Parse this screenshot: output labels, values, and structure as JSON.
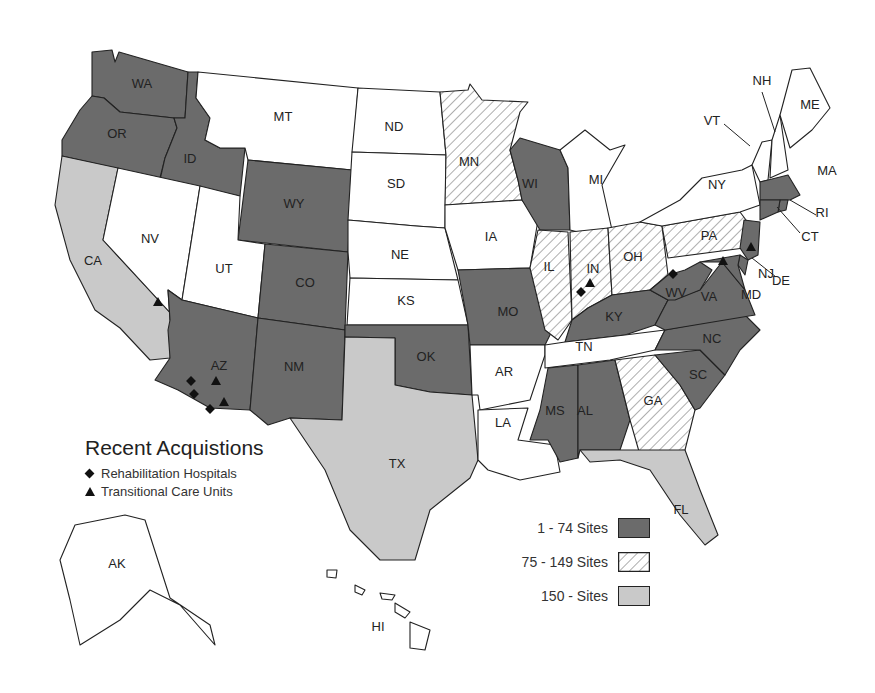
{
  "legend": {
    "title": "Recent Acquistions",
    "symbols": [
      {
        "icon": "diamond-icon",
        "label": "Rehabilitation Hospitals"
      },
      {
        "icon": "triangle-icon",
        "label": "Transitional Care Units"
      }
    ]
  },
  "key": [
    {
      "label": "1 - 74 Sites",
      "category": "low",
      "fill": "#6b6b6b"
    },
    {
      "label": "75 - 149 Sites",
      "category": "mid",
      "fill": "hatch"
    },
    {
      "label": "150 - Sites",
      "category": "high",
      "fill": "#c9c9c9"
    }
  ],
  "colors": {
    "low": "#6b6b6b",
    "high": "#c9c9c9",
    "none": "#ffffff",
    "hatch_line": "#777777"
  },
  "states": [
    {
      "code": "WA",
      "category": "low"
    },
    {
      "code": "OR",
      "category": "low"
    },
    {
      "code": "ID",
      "category": "low"
    },
    {
      "code": "MT",
      "category": "none"
    },
    {
      "code": "WY",
      "category": "low"
    },
    {
      "code": "CA",
      "category": "high"
    },
    {
      "code": "NV",
      "category": "none"
    },
    {
      "code": "UT",
      "category": "none"
    },
    {
      "code": "AZ",
      "category": "low"
    },
    {
      "code": "CO",
      "category": "low"
    },
    {
      "code": "NM",
      "category": "low"
    },
    {
      "code": "ND",
      "category": "none"
    },
    {
      "code": "SD",
      "category": "none"
    },
    {
      "code": "NE",
      "category": "none"
    },
    {
      "code": "KS",
      "category": "none"
    },
    {
      "code": "OK",
      "category": "low"
    },
    {
      "code": "TX",
      "category": "high"
    },
    {
      "code": "MN",
      "category": "mid"
    },
    {
      "code": "IA",
      "category": "none"
    },
    {
      "code": "MO",
      "category": "low"
    },
    {
      "code": "AR",
      "category": "none"
    },
    {
      "code": "LA",
      "category": "none"
    },
    {
      "code": "WI",
      "category": "low"
    },
    {
      "code": "IL",
      "category": "mid"
    },
    {
      "code": "MI",
      "category": "none"
    },
    {
      "code": "IN",
      "category": "mid"
    },
    {
      "code": "OH",
      "category": "mid"
    },
    {
      "code": "KY",
      "category": "low"
    },
    {
      "code": "TN",
      "category": "none"
    },
    {
      "code": "MS",
      "category": "low"
    },
    {
      "code": "AL",
      "category": "low"
    },
    {
      "code": "GA",
      "category": "mid"
    },
    {
      "code": "FL",
      "category": "high"
    },
    {
      "code": "SC",
      "category": "low"
    },
    {
      "code": "NC",
      "category": "low"
    },
    {
      "code": "VA",
      "category": "low"
    },
    {
      "code": "WV",
      "category": "low"
    },
    {
      "code": "PA",
      "category": "mid"
    },
    {
      "code": "NY",
      "category": "none"
    },
    {
      "code": "VT",
      "category": "none"
    },
    {
      "code": "NH",
      "category": "none"
    },
    {
      "code": "ME",
      "category": "none"
    },
    {
      "code": "MA",
      "category": "low"
    },
    {
      "code": "RI",
      "category": "low"
    },
    {
      "code": "CT",
      "category": "low"
    },
    {
      "code": "NJ",
      "category": "low"
    },
    {
      "code": "DE",
      "category": "low"
    },
    {
      "code": "MD",
      "category": "low"
    },
    {
      "code": "AK",
      "category": "none"
    },
    {
      "code": "HI",
      "category": "none"
    }
  ],
  "acquisitions": [
    {
      "state": "NV",
      "type": "transitional"
    },
    {
      "state": "AZ",
      "type": "rehabilitation"
    },
    {
      "state": "AZ",
      "type": "rehabilitation"
    },
    {
      "state": "AZ",
      "type": "rehabilitation"
    },
    {
      "state": "AZ",
      "type": "transitional"
    },
    {
      "state": "AZ",
      "type": "transitional"
    },
    {
      "state": "IN",
      "type": "rehabilitation"
    },
    {
      "state": "IN",
      "type": "transitional"
    },
    {
      "state": "WV",
      "type": "rehabilitation"
    },
    {
      "state": "MD",
      "type": "transitional"
    },
    {
      "state": "NJ",
      "type": "transitional"
    }
  ]
}
